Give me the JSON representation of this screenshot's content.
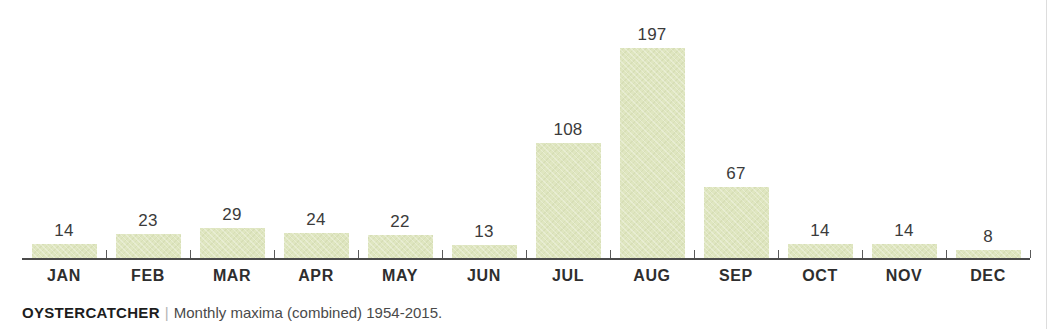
{
  "caption": {
    "title": "OYSTERCATCHER",
    "separator": "|",
    "subtitle": "Monthly maxima (combined) 1954-2015."
  },
  "colors": {
    "bar_fill": "#dfe6c0",
    "axis": "#4b4b4b",
    "value_label": "#3b3b3b",
    "category_label": "#2e2e2e",
    "caption_title": "#1d1d1d",
    "caption_separator": "#b4b4b4",
    "caption_subtitle": "#4a4a4a",
    "background": "#ffffff"
  },
  "chart_data": {
    "type": "bar",
    "title": "OYSTERCATCHER",
    "subtitle": "Monthly maxima (combined) 1954-2015.",
    "xlabel": "",
    "ylabel": "",
    "ylim": [
      0,
      197
    ],
    "grid": false,
    "legend": false,
    "value_labels": true,
    "categories": [
      "JAN",
      "FEB",
      "MAR",
      "APR",
      "MAY",
      "JUN",
      "JUL",
      "AUG",
      "SEP",
      "OCT",
      "NOV",
      "DEC"
    ],
    "values": [
      14,
      23,
      29,
      24,
      22,
      13,
      108,
      197,
      67,
      14,
      14,
      8
    ]
  }
}
